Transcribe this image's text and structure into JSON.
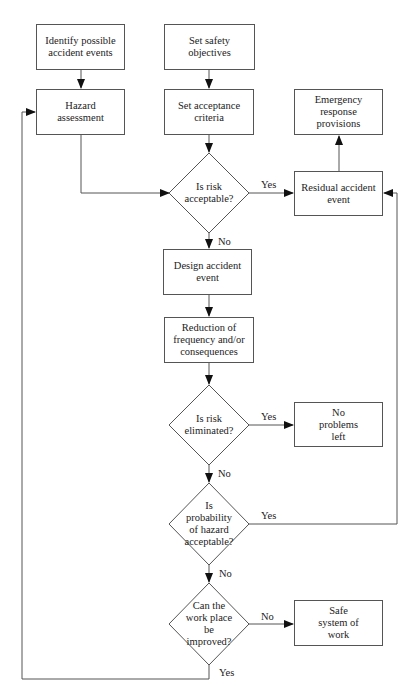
{
  "diagram": {
    "type": "flowchart",
    "nodes": {
      "identify": {
        "shape": "rect",
        "label": "Identify possible accident events"
      },
      "objectives": {
        "shape": "rect",
        "label": "Set safety objectives"
      },
      "hazard": {
        "shape": "rect",
        "label": "Hazard assessment"
      },
      "criteria": {
        "shape": "rect",
        "label": "Set acceptance criteria"
      },
      "emergency": {
        "shape": "rect",
        "label": "Emergency response provisions"
      },
      "risk_acceptable": {
        "shape": "diamond",
        "label": "Is risk acceptable?"
      },
      "residual": {
        "shape": "rect",
        "label": "Residual accident event"
      },
      "design": {
        "shape": "rect",
        "label": "Design accident event"
      },
      "reduction": {
        "shape": "rect",
        "label": "Reduction of frequency and/or consequences"
      },
      "risk_eliminated": {
        "shape": "diamond",
        "label": "Is risk eliminated?"
      },
      "no_problems": {
        "shape": "rect",
        "label": "No problems left"
      },
      "probability": {
        "shape": "diamond",
        "label": "Is probability of hazard acceptable?"
      },
      "improve": {
        "shape": "diamond",
        "label": "Can the work place be improved?"
      },
      "safe_system": {
        "shape": "rect",
        "label": "Safe system of work"
      }
    },
    "edges": {
      "risk_acceptable_yes": "Yes",
      "risk_acceptable_no": "No",
      "risk_eliminated_yes": "Yes",
      "risk_eliminated_no": "No",
      "probability_yes": "Yes",
      "probability_no": "No",
      "improve_no": "No",
      "improve_yes": "Yes"
    },
    "connections": [
      [
        "identify",
        "hazard"
      ],
      [
        "objectives",
        "criteria"
      ],
      [
        "hazard",
        "risk_acceptable"
      ],
      [
        "criteria",
        "risk_acceptable"
      ],
      [
        "risk_acceptable",
        "residual",
        "Yes"
      ],
      [
        "residual",
        "emergency"
      ],
      [
        "risk_acceptable",
        "design",
        "No"
      ],
      [
        "design",
        "reduction"
      ],
      [
        "reduction",
        "risk_eliminated"
      ],
      [
        "risk_eliminated",
        "no_problems",
        "Yes"
      ],
      [
        "risk_eliminated",
        "probability",
        "No"
      ],
      [
        "probability",
        "residual",
        "Yes"
      ],
      [
        "probability",
        "improve",
        "No"
      ],
      [
        "improve",
        "safe_system",
        "No"
      ],
      [
        "improve",
        "hazard",
        "Yes"
      ]
    ]
  }
}
